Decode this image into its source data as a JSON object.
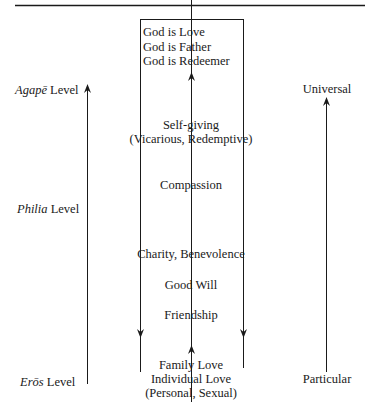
{
  "levels": {
    "agape": {
      "term": "Agapē",
      "suffix": " Level"
    },
    "philia": {
      "term": "Philia",
      "suffix": " Level"
    },
    "eros": {
      "term": "Erōs",
      "suffix": " Level"
    }
  },
  "scope": {
    "top": "Universal",
    "bottom": "Particular"
  },
  "god": [
    "God is Love",
    "God is Father",
    "God is Redeemer"
  ],
  "stages": {
    "self_giving": "Self-giving",
    "self_giving_note": "(Vicarious, Redemptive)",
    "compassion": "Compassion",
    "charity": "Charity, Benevolence",
    "good_will": "Good Will",
    "friendship": "Friendship",
    "family_love": "Family Love",
    "individual_love": "Individual Love",
    "individual_note": "(Personal, Sexual)"
  },
  "colors": {
    "ink": "#1a1a1a",
    "background": "#ffffff"
  }
}
